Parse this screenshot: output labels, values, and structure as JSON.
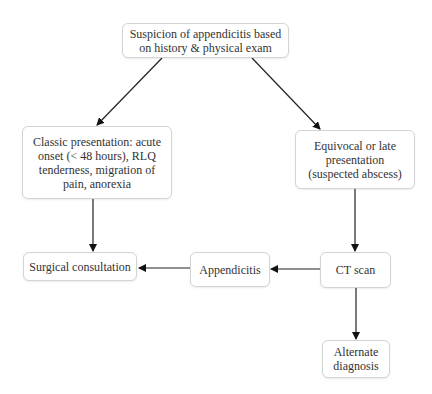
{
  "diagram": {
    "type": "flowchart",
    "nodes": {
      "suspicion": "Suspicion of appendicitis based\non history & physical exam",
      "classic": "Classic presentation: acute\nonset (< 48 hours), RLQ\ntenderness, migration of\npain, anorexia",
      "equivocal": "Equivocal or late\npresentation\n(suspected abscess)",
      "surgical": "Surgical consultation",
      "appendicitis": "Appendicitis",
      "ct_scan": "CT scan",
      "alternate": "Alternate\ndiagnosis"
    },
    "edges": [
      {
        "from": "suspicion",
        "to": "classic"
      },
      {
        "from": "suspicion",
        "to": "equivocal"
      },
      {
        "from": "classic",
        "to": "surgical"
      },
      {
        "from": "equivocal",
        "to": "ct_scan"
      },
      {
        "from": "ct_scan",
        "to": "appendicitis"
      },
      {
        "from": "appendicitis",
        "to": "surgical"
      },
      {
        "from": "ct_scan",
        "to": "alternate"
      }
    ]
  }
}
